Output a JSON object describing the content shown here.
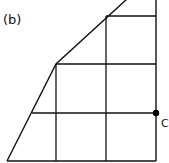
{
  "figure": {
    "label": "(b)",
    "point": {
      "name": "C",
      "color": "#000000"
    },
    "line_color": "#111111",
    "outline": {
      "description": "Trapezoid-like shape with slanted left side bounded by a grid",
      "vertices": [
        [
          7,
          161
        ],
        [
          56,
          64
        ],
        [
          126,
          0
        ],
        [
          156,
          0
        ],
        [
          156,
          161
        ]
      ]
    },
    "grid": {
      "vertical_x": [
        56,
        106,
        156
      ],
      "horizontal_y": [
        16,
        64,
        113,
        161
      ]
    }
  }
}
